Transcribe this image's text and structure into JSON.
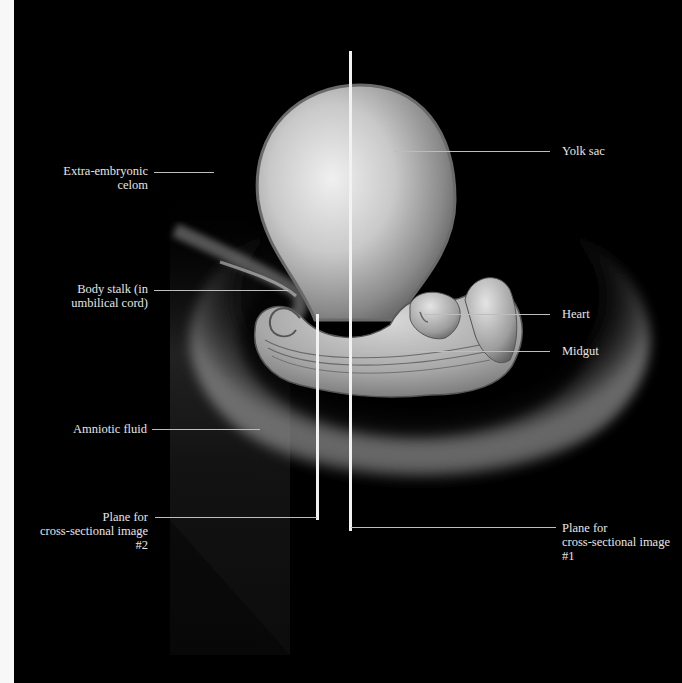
{
  "figure": {
    "background": "#000000",
    "labels": {
      "extra_embryonic_celom": [
        "Extra-embryonic",
        "celom"
      ],
      "body_stalk": [
        "Body stalk (in",
        "umbilical cord)"
      ],
      "amniotic_fluid": "Amniotic fluid",
      "plane2": [
        "Plane for",
        "cross-sectional image",
        "#2"
      ],
      "yolk_sac": "Yolk sac",
      "heart": "Heart",
      "midgut": "Midgut",
      "plane1": [
        "Plane for",
        "cross-sectional image",
        "#1"
      ]
    },
    "colors": {
      "label_text": "#e6e6e6",
      "leader_line": "#bdbdbd",
      "plane_line": "#f2f2f2"
    }
  }
}
